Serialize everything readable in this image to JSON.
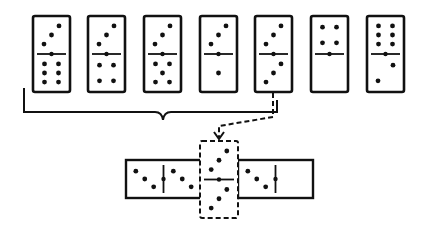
{
  "colors": {
    "ink": "#111111",
    "background": "#ffffff"
  },
  "top_row": {
    "dominoes": [
      {
        "id": "d1",
        "top": 3,
        "bottom": 6,
        "grouped": true
      },
      {
        "id": "d2",
        "top": 3,
        "bottom": 4,
        "grouped": true
      },
      {
        "id": "d3",
        "top": 3,
        "bottom": 5,
        "grouped": true
      },
      {
        "id": "d4",
        "top": 3,
        "bottom": 1,
        "grouped": true
      },
      {
        "id": "d5",
        "top": 3,
        "bottom": 3,
        "grouped": true,
        "selected": true
      },
      {
        "id": "d6",
        "top": 4,
        "bottom": 0,
        "grouped": false
      },
      {
        "id": "d7",
        "top": 6,
        "bottom": 2,
        "grouped": false
      }
    ]
  },
  "bracket": {
    "spans": [
      "d1",
      "d2",
      "d3",
      "d4",
      "d5"
    ]
  },
  "arrow": {
    "from": "d5",
    "to": "placed-center",
    "style": "dashed"
  },
  "chain": {
    "left": {
      "left": 3,
      "right": 3,
      "orientation": "horizontal"
    },
    "center": {
      "top": 3,
      "bottom": 3,
      "orientation": "vertical",
      "style": "dashed"
    },
    "right": {
      "left": 3,
      "right": 0,
      "orientation": "horizontal"
    }
  }
}
